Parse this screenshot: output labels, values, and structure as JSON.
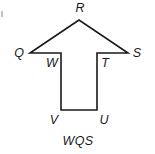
{
  "figure": {
    "caption": "WQS",
    "shape_name": "arrow-polygon",
    "stroke_color": "#1a1a1a",
    "fill_color": "#ffffff",
    "background_color": "#ffffff",
    "vertices": [
      {
        "id": "R",
        "label": "R",
        "x": 79,
        "y": 20,
        "label_x": 80,
        "label_y": 12
      },
      {
        "id": "Q",
        "label": "Q",
        "x": 30,
        "y": 53,
        "label_x": 19,
        "label_y": 57
      },
      {
        "id": "W",
        "label": "W",
        "x": 61,
        "y": 53,
        "label_x": 52,
        "label_y": 67
      },
      {
        "id": "V",
        "label": "V",
        "x": 61,
        "y": 110,
        "label_x": 54,
        "label_y": 124
      },
      {
        "id": "U",
        "label": "U",
        "x": 97,
        "y": 110,
        "label_x": 104,
        "label_y": 124
      },
      {
        "id": "T",
        "label": "T",
        "x": 97,
        "y": 53,
        "label_x": 105,
        "label_y": 67
      },
      {
        "id": "S",
        "label": "S",
        "x": 128,
        "y": 53,
        "label_x": 137,
        "label_y": 57
      }
    ],
    "outline_path": "M 79 20 L 30 53 L 61 53 L 61 110 L 97 110 L 97 53 L 128 53 Z",
    "edge_tick": {
      "x": 2,
      "y1": 11,
      "y2": 17
    }
  }
}
